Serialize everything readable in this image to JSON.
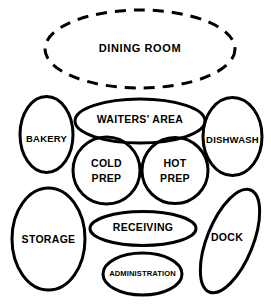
{
  "diagram": {
    "background_color": "#ffffff",
    "stroke_color": "#000000",
    "bubbles": [
      {
        "id": "dining-room",
        "label": "DINING  ROOM",
        "shape": "ellipse",
        "border_style": "dashed",
        "cx": 140,
        "cy": 49,
        "rx": 95,
        "ry": 39,
        "rotation": 0,
        "label_x": 140,
        "label_y": 49
      },
      {
        "id": "waiters-area",
        "label": "WAITERS'  AREA",
        "shape": "ellipse",
        "border_style": "solid",
        "cx": 140,
        "cy": 121,
        "rx": 65,
        "ry": 22,
        "rotation": 0,
        "label_x": 140,
        "label_y": 120
      },
      {
        "id": "bakery",
        "label": "BAKERY",
        "shape": "ellipse",
        "border_style": "solid",
        "cx": 46.5,
        "cy": 134.5,
        "rx": 26.5,
        "ry": 38,
        "rotation": 0,
        "label_x": 46.5,
        "label_y": 139
      },
      {
        "id": "dishwash",
        "label": "DISHWASH",
        "shape": "ellipse",
        "border_style": "solid",
        "cx": 232.5,
        "cy": 136.5,
        "rx": 29.5,
        "ry": 39,
        "rotation": 0,
        "label_x": 232.5,
        "label_y": 140
      },
      {
        "id": "cold-prep",
        "label_line1": "COLD",
        "label_line2": "PREP",
        "shape": "circle",
        "border_style": "solid",
        "cx": 106.5,
        "cy": 170.5,
        "rx": 33.5,
        "ry": 33,
        "rotation": 0,
        "label_x": 106.5,
        "label_y": 164
      },
      {
        "id": "hot-prep",
        "label_line1": "HOT",
        "label_line2": "PREP",
        "shape": "circle",
        "border_style": "solid",
        "cx": 175,
        "cy": 170.5,
        "rx": 33,
        "ry": 33,
        "rotation": 0,
        "label_x": 175,
        "label_y": 164
      },
      {
        "id": "storage",
        "label": "STORAGE",
        "shape": "ellipse",
        "border_style": "solid",
        "cx": 48.5,
        "cy": 239,
        "rx": 36.5,
        "ry": 51,
        "rotation": 0,
        "label_x": 48.5,
        "label_y": 240
      },
      {
        "id": "receiving",
        "label": "RECEIVING",
        "shape": "ellipse",
        "border_style": "solid",
        "cx": 143,
        "cy": 228.5,
        "rx": 53,
        "ry": 17,
        "rotation": 0,
        "label_x": 143,
        "label_y": 228
      },
      {
        "id": "dock",
        "label": "DOCK",
        "shape": "ellipse",
        "border_style": "solid",
        "cx": 230,
        "cy": 241,
        "rx": 23,
        "ry": 55,
        "rotation": 22,
        "label_x": 227,
        "label_y": 238
      },
      {
        "id": "administration",
        "label": "ADMINISTRATION",
        "shape": "ellipse",
        "border_style": "solid",
        "cx": 142.5,
        "cy": 274,
        "rx": 39.5,
        "ry": 21,
        "rotation": 0,
        "label_x": 142.5,
        "label_y": 274
      }
    ]
  }
}
